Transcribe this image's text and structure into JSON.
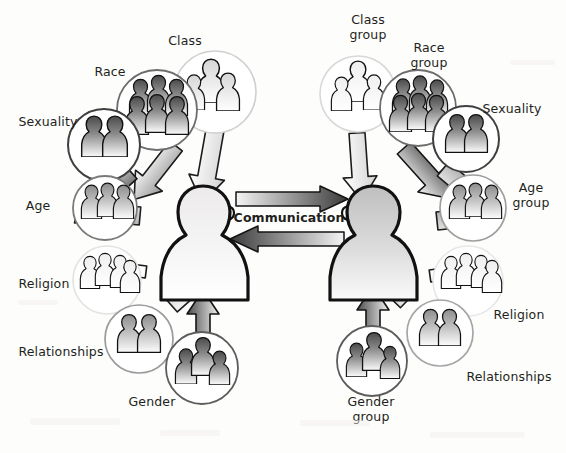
{
  "diagram": {
    "background_color": "#fdfdfc",
    "text_color": "#231f20",
    "center_label": "Communication",
    "center_figures": [
      {
        "name": "individual-person-left",
        "facing": "right"
      },
      {
        "name": "group-person-right",
        "facing": "left"
      }
    ],
    "center_arrows": [
      {
        "name": "communication-arrow-right",
        "direction": "right",
        "from": "individual-person-left",
        "to": "group-person-right"
      },
      {
        "name": "communication-arrow-left",
        "direction": "left",
        "from": "group-person-right",
        "to": "individual-person-left"
      }
    ],
    "left_side": {
      "caption": "Individual influences",
      "nodes": [
        {
          "id": "class",
          "label": "Class",
          "figures": 3,
          "tone": "light",
          "cx": 215,
          "cy": 92,
          "r": 41,
          "lx": 185,
          "ly": 40
        },
        {
          "id": "race",
          "label": "Race",
          "figures": 6,
          "tone": "dark",
          "cx": 157,
          "cy": 110,
          "r": 40,
          "lx": 110,
          "ly": 71
        },
        {
          "id": "sexuality",
          "label": "Sexuality",
          "figures": 2,
          "tone": "dark",
          "cx": 104,
          "cy": 145,
          "r": 36,
          "lx": 48,
          "ly": 121
        },
        {
          "id": "age",
          "label": "Age",
          "figures": 3,
          "tone": "medium",
          "cx": 105,
          "cy": 208,
          "r": 32,
          "lx": 38,
          "ly": 205
        },
        {
          "id": "religion",
          "label": "Religion",
          "figures": 4,
          "tone": "pale",
          "cx": 107,
          "cy": 280,
          "r": 34,
          "lx": 44,
          "ly": 283
        },
        {
          "id": "relationships",
          "label": "Relationships",
          "figures": 2,
          "tone": "medium",
          "cx": 139,
          "cy": 339,
          "r": 34,
          "lx": 61,
          "ly": 351
        },
        {
          "id": "gender",
          "label": "Gender",
          "figures": 3,
          "tone": "dark",
          "cx": 202,
          "cy": 368,
          "r": 36,
          "lx": 152,
          "ly": 401
        }
      ]
    },
    "right_side": {
      "caption": "Group influences",
      "nodes": [
        {
          "id": "class-group",
          "label": "Class\ngroup",
          "figures": 3,
          "tone": "pale",
          "cx": 358,
          "cy": 94,
          "r": 38,
          "lx": 368,
          "ly": 27
        },
        {
          "id": "race-group",
          "label": "Race\ngroup",
          "figures": 6,
          "tone": "dark",
          "cx": 418,
          "cy": 108,
          "r": 38,
          "lx": 429,
          "ly": 55
        },
        {
          "id": "sexuality-r",
          "label": "Sexuality",
          "figures": 2,
          "tone": "dark",
          "cx": 466,
          "cy": 139,
          "r": 33,
          "lx": 512,
          "ly": 108
        },
        {
          "id": "age-group",
          "label": "Age\ngroup",
          "figures": 3,
          "tone": "medium",
          "cx": 473,
          "cy": 208,
          "r": 33,
          "lx": 531,
          "ly": 195
        },
        {
          "id": "religion-r",
          "label": "Religion",
          "figures": 4,
          "tone": "pale",
          "cx": 468,
          "cy": 281,
          "r": 35,
          "lx": 519,
          "ly": 314
        },
        {
          "id": "relationships-r",
          "label": "Relationships",
          "figures": 2,
          "tone": "medium",
          "cx": 440,
          "cy": 333,
          "r": 33,
          "lx": 509,
          "ly": 376
        },
        {
          "id": "gender-group",
          "label": "Gender\ngroup",
          "figures": 3,
          "tone": "dark",
          "cx": 372,
          "cy": 361,
          "r": 35,
          "lx": 371,
          "ly": 409
        }
      ]
    }
  }
}
